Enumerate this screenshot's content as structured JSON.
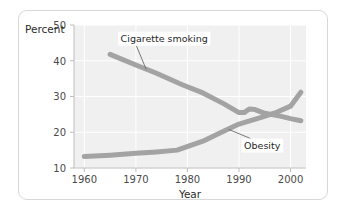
{
  "chart_data": {
    "type": "line",
    "title": "",
    "xlabel": "Year",
    "ylabel": "Percent",
    "xlim": [
      1958,
      2003
    ],
    "ylim": [
      10,
      50
    ],
    "xticks": [
      1960,
      1970,
      1980,
      1990,
      2000
    ],
    "yticks": [
      10,
      20,
      30,
      40,
      50
    ],
    "xtick_labels": [
      "1960",
      "1970",
      "1980",
      "1990",
      "2000"
    ],
    "ytick_labels": [
      "10",
      "20",
      "30",
      "40",
      "50"
    ],
    "grid": true,
    "legend": "annotations",
    "line_color": "#a3a3a3",
    "plot_bg_color": "#f0f0f0",
    "grid_color": "#ffffff",
    "series": [
      {
        "name": "Cigarette smoking",
        "label": "Cigarette smoking",
        "x": [
          1965,
          1970,
          1974,
          1979,
          1983,
          1987,
          1990,
          1991,
          1992,
          1993,
          1995,
          1998,
          2000,
          2002
        ],
        "values": [
          41.8,
          38.8,
          36.5,
          33.3,
          31.0,
          28.0,
          25.5,
          25.5,
          26.5,
          26.4,
          25.3,
          24.5,
          23.8,
          23.2
        ]
      },
      {
        "name": "Obesity",
        "label": "Obesity",
        "x": [
          1960,
          1965,
          1970,
          1974,
          1978,
          1983,
          1987,
          1990,
          1994,
          1997,
          2000,
          2002
        ],
        "values": [
          13.2,
          13.6,
          14.1,
          14.5,
          15.0,
          17.5,
          20.3,
          22.3,
          24.0,
          25.4,
          27.3,
          31.2
        ]
      }
    ],
    "annotations": [
      {
        "text": "Cigarette smoking",
        "label_x": 1975.5,
        "label_y": 45.2,
        "point_x": 1972.0,
        "point_y": 37.6
      },
      {
        "text": "Obesity",
        "label_x": 1994.5,
        "label_y": 15.3,
        "point_x": 1988.0,
        "point_y": 20.8
      }
    ]
  }
}
